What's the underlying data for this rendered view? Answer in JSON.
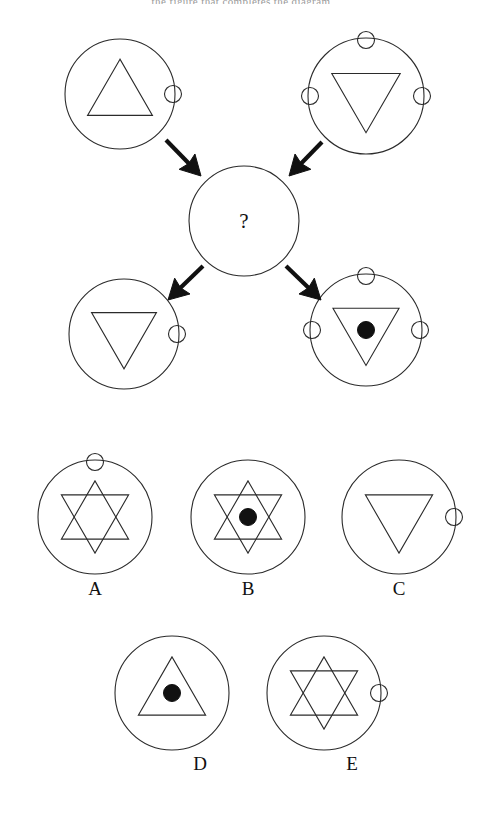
{
  "page": {
    "background_color": "#ffffff",
    "stroke_color": "#2b2b2b",
    "fill_color": "#111111",
    "cut_off_header_text": "the  figure  that  completes  the  diagram"
  },
  "matrix": {
    "center": {
      "name": "center-unknown",
      "question_mark": "?",
      "cx": 244,
      "cy": 221,
      "r": 55
    },
    "cells": [
      {
        "id": "top-left",
        "cx": 120,
        "cy": 94,
        "r": 55,
        "triangle": "up",
        "center_dot": false,
        "small_circles": [
          "right"
        ]
      },
      {
        "id": "top-right",
        "cx": 366,
        "cy": 96,
        "r": 58,
        "triangle": "down",
        "center_dot": false,
        "small_circles": [
          "top",
          "left",
          "right"
        ]
      },
      {
        "id": "bottom-left",
        "cx": 124,
        "cy": 334,
        "r": 55,
        "triangle": "down",
        "center_dot": false,
        "small_circles": [
          "right"
        ]
      },
      {
        "id": "bottom-right",
        "cx": 366,
        "cy": 330,
        "r": 56,
        "triangle": "down",
        "center_dot": true,
        "small_circles": [
          "top",
          "left",
          "right"
        ]
      }
    ],
    "arrows": [
      {
        "id": "arrow-top-left",
        "from": [
          166,
          140
        ],
        "to": [
          201,
          176
        ]
      },
      {
        "id": "arrow-top-right",
        "from": [
          322,
          142
        ],
        "to": [
          289,
          176
        ]
      },
      {
        "id": "arrow-bottom-left",
        "from": [
          203,
          266
        ],
        "to": [
          168,
          300
        ]
      },
      {
        "id": "arrow-bottom-right",
        "from": [
          286,
          266
        ],
        "to": [
          321,
          300
        ]
      }
    ]
  },
  "options": {
    "row1": [
      {
        "label": "A",
        "cx": 95,
        "cy": 517,
        "r": 57,
        "shape": "star",
        "center_dot": false,
        "small_circles": [
          "top"
        ],
        "label_x": 95,
        "label_y": 580
      },
      {
        "label": "B",
        "cx": 248,
        "cy": 517,
        "r": 57,
        "shape": "star",
        "center_dot": true,
        "small_circles": [],
        "label_x": 248,
        "label_y": 580
      },
      {
        "label": "C",
        "cx": 399,
        "cy": 517,
        "r": 57,
        "shape": "triangle-down",
        "center_dot": false,
        "small_circles": [
          "right"
        ],
        "label_x": 399,
        "label_y": 580
      }
    ],
    "row2": [
      {
        "label": "D",
        "cx": 172,
        "cy": 693,
        "r": 57,
        "shape": "triangle-up",
        "center_dot": true,
        "small_circles": [],
        "label_x": 172,
        "label_y": 755
      },
      {
        "label": "E",
        "cx": 324,
        "cy": 693,
        "r": 57,
        "shape": "star",
        "center_dot": false,
        "small_circles": [
          "right"
        ],
        "label_x": 324,
        "label_y": 755
      }
    ]
  }
}
